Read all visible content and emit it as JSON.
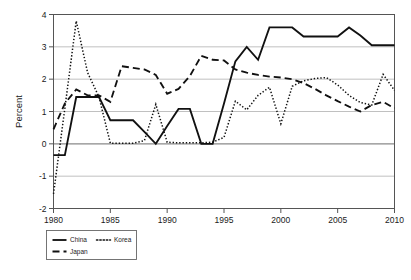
{
  "chart_data": {
    "type": "line",
    "title": "",
    "subtitle": "",
    "xlabel": "",
    "ylabel": "Percent",
    "xlim": [
      1980,
      2010
    ],
    "ylim": [
      -2,
      4
    ],
    "grid": true,
    "legend_position": "below-left",
    "x_ticks": [
      1980,
      1985,
      1990,
      1995,
      2000,
      2005,
      2010
    ],
    "x_tick_labels": [
      "1980",
      "1985",
      "1990",
      "1995",
      "2000",
      "2005",
      "2010"
    ],
    "y_ticks": [
      -2,
      -1,
      0,
      1,
      2,
      3,
      4
    ],
    "y_tick_labels": [
      "-2",
      "-1",
      "0",
      "1",
      "2",
      "3",
      "4"
    ],
    "x": [
      1980,
      1981,
      1982,
      1983,
      1984,
      1985,
      1986,
      1987,
      1988,
      1989,
      1990,
      1991,
      1992,
      1993,
      1994,
      1995,
      1996,
      1997,
      1998,
      1999,
      2000,
      2001,
      2002,
      2003,
      2004,
      2005,
      2006,
      2007,
      2008,
      2009,
      2010
    ],
    "series": [
      {
        "name": "China",
        "style": "solid",
        "color": "#111111",
        "values": [
          -0.35,
          -0.35,
          1.45,
          1.45,
          1.45,
          0.73,
          0.73,
          0.73,
          0.37,
          0.0,
          0.55,
          1.08,
          1.08,
          0.0,
          0.0,
          1.25,
          2.55,
          3.0,
          2.6,
          3.6,
          3.6,
          3.6,
          3.32,
          3.32,
          3.32,
          3.32,
          3.6,
          3.35,
          3.05,
          3.05,
          3.05
        ]
      },
      {
        "name": "Japan",
        "style": "dashed",
        "color": "#111111",
        "values": [
          0.45,
          1.25,
          1.68,
          1.5,
          1.5,
          1.3,
          2.4,
          2.35,
          2.3,
          2.13,
          1.55,
          1.7,
          2.1,
          2.72,
          2.6,
          2.58,
          2.3,
          2.2,
          2.13,
          2.08,
          2.05,
          2.0,
          1.88,
          1.7,
          1.5,
          1.32,
          1.15,
          1.0,
          1.2,
          1.3,
          1.1
        ]
      },
      {
        "name": "Korea",
        "style": "dotted",
        "color": "#111111",
        "values": [
          -1.55,
          1.1,
          3.8,
          2.2,
          1.45,
          0.02,
          0.02,
          0.02,
          0.1,
          1.22,
          0.05,
          0.03,
          0.03,
          0.03,
          0.05,
          0.2,
          1.32,
          1.05,
          1.5,
          1.75,
          0.62,
          1.78,
          1.95,
          2.02,
          2.05,
          1.82,
          1.5,
          1.28,
          1.2,
          2.15,
          1.65
        ]
      }
    ]
  },
  "legend": {
    "items": [
      {
        "label": "China",
        "style": "solid"
      },
      {
        "label": "Korea",
        "style": "dotted"
      },
      {
        "label": "Japan",
        "style": "dashed"
      }
    ]
  }
}
